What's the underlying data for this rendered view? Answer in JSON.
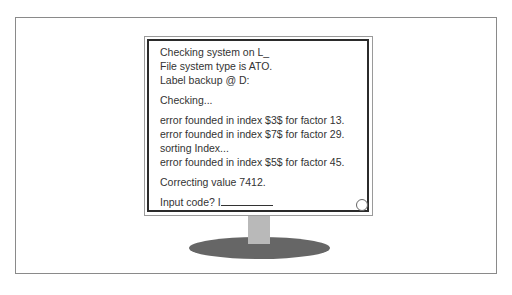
{
  "illustration": {
    "type": "computer monitor on stand",
    "colors": {
      "frame": "#8a8a8a",
      "bezel_dark": "#2b2b2b",
      "text": "#333333",
      "neck": "#b9b9b9",
      "base": "#666666"
    }
  },
  "screen": {
    "lines": [
      "Checking system on L_",
      "File system type is ATO.",
      "Label backup @ D:",
      "Checking...",
      "error founded in index $3$ for factor 13.",
      "error founded in index $7$ for factor 29.",
      "sorting Index...",
      "error founded in index $5$ for factor 45.",
      "Correcting value 7412.",
      "Input code? I"
    ]
  }
}
